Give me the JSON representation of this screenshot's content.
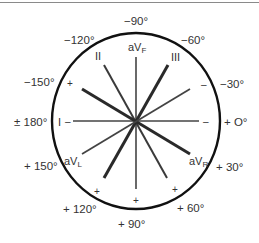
{
  "diagram": {
    "center": {
      "x": 136,
      "y": 121
    },
    "circle": {
      "rx": 84,
      "ry": 88,
      "stroke": "#111111"
    },
    "angle_labels": {
      "neg90": "−90°",
      "neg120": "−120°",
      "neg60": "−60°",
      "neg150": "−150°",
      "neg30": "−30°",
      "pm180": "± 180°",
      "pos0": "+ O°",
      "pos150": "+ 150°",
      "pos30": "+ 30°",
      "pos120": "+ 120°",
      "pos60": "+ 60°",
      "pos90": "+ 90°"
    },
    "leads": {
      "I": "I",
      "II": "II",
      "III": "III",
      "aVF": {
        "base": "aV",
        "sub": "F"
      },
      "aVL": {
        "base": "aV",
        "sub": "L"
      },
      "aVR": {
        "base": "aV",
        "sub": "R"
      }
    },
    "signs": {
      "plus": "+",
      "minus": "–"
    },
    "lines": [
      {
        "name": "lead-I-axis",
        "x1": 73,
        "y1": 121,
        "x2": 199,
        "y2": 121,
        "width": 1.6,
        "color": "#444444"
      },
      {
        "name": "lead-aVF-axis",
        "x1": 136,
        "y1": 57,
        "x2": 136,
        "y2": 189,
        "width": 1.6,
        "color": "#444444"
      },
      {
        "name": "lead-II-axis",
        "x1": 104,
        "y1": 65,
        "x2": 167,
        "y2": 178,
        "width": 2,
        "color": "#3a3a3a"
      },
      {
        "name": "lead-III-axis",
        "x1": 168,
        "y1": 65,
        "x2": 104,
        "y2": 178,
        "width": 3,
        "color": "#2a2a2a"
      },
      {
        "name": "lead-aVR-axis",
        "x1": 82,
        "y1": 89,
        "x2": 190,
        "y2": 154,
        "width": 3,
        "color": "#2a2a2a"
      },
      {
        "name": "lead-aVL-axis",
        "x1": 190,
        "y1": 89,
        "x2": 82,
        "y2": 154,
        "width": 1.8,
        "color": "#444444"
      }
    ]
  }
}
